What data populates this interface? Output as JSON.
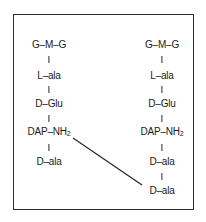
{
  "diagram": {
    "type": "peptidoglycan-crosslink",
    "left_chain": {
      "residues": [
        "G–M–G",
        "L–ala",
        "D–Glu",
        "DAP–NH",
        "D–ala"
      ],
      "dap_subscript": "2"
    },
    "right_chain": {
      "residues": [
        "G–M–G",
        "L–ala",
        "D–Glu",
        "DAP–NH",
        "D–ala",
        "D–ala"
      ],
      "dap_subscript": "2"
    },
    "crosslink": {
      "from": "left_chain.DAP–NH2",
      "to": "right_chain.D–ala (terminal)"
    },
    "colors": {
      "line": "#2a2a2a",
      "text": "#1a1a1a",
      "background": "#ffffff"
    }
  }
}
